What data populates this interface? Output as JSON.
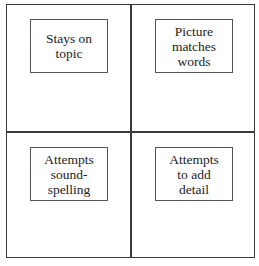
{
  "quadrants": [
    {
      "position": "top-left",
      "label": "Stays on\ntopic"
    },
    {
      "position": "top-right",
      "label": "Picture\nmatches\nwords"
    },
    {
      "position": "bottom-left",
      "label": "Attempts\nsound-\nspelling"
    },
    {
      "position": "bottom-right",
      "label": "Attempts\nto add\ndetail"
    }
  ],
  "colors": {
    "border": "#3a3a3a",
    "label_border": "#555555",
    "text": "#222222",
    "background": "#ffffff"
  }
}
